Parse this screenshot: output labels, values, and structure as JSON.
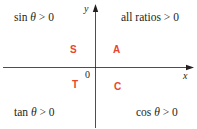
{
  "diagram": {
    "axes": {
      "x_label": "x",
      "y_label": "y",
      "origin_label": "0",
      "color": "#231f20"
    },
    "quadrants": [
      {
        "id": "II",
        "letter": "S",
        "statement_prefix": "sin ",
        "statement_var": "θ",
        "statement_suffix": " > 0"
      },
      {
        "id": "I",
        "letter": "A",
        "statement": "all ratios > 0"
      },
      {
        "id": "III",
        "letter": "T",
        "statement_prefix": "tan ",
        "statement_var": "θ",
        "statement_suffix": " > 0"
      },
      {
        "id": "IV",
        "letter": "C",
        "statement_prefix": "cos ",
        "statement_var": "θ",
        "statement_suffix": " > 0"
      }
    ],
    "colors": {
      "letter": "#e8452b",
      "text": "#231f20",
      "background": "#ffffff"
    }
  }
}
